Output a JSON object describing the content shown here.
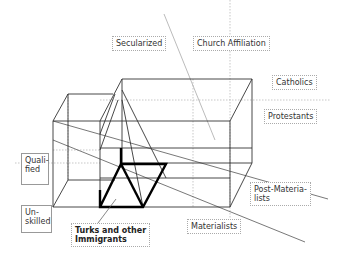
{
  "diagram": {
    "type": "3D social-space cube diagram",
    "labels": {
      "secularized": "Secularized",
      "church_affiliation": "Church Affiliation",
      "catholics": "Catholics",
      "protestants": "Protestants",
      "qualified_line1": "Quali-",
      "qualified_line2": "fied",
      "unskilled_line1": "Un-",
      "unskilled_line2": "skilled",
      "turks_line1": "Turks and other",
      "turks_line2": "Immigrants",
      "post_materialists_line1": "Post-Materia-",
      "post_materialists_line2": "lists",
      "materialists": "Materialists"
    },
    "axes": {
      "religion": [
        "Secularized",
        "Church Affiliation",
        "Catholics",
        "Protestants"
      ],
      "qualification": [
        "Qualified",
        "Unskilled"
      ],
      "values": [
        "Post-Materialists",
        "Materialists"
      ]
    },
    "highlighted_group": "Turks and other Immigrants",
    "colors": {
      "line": "#333333",
      "dotted": "#aaaaaa",
      "bold": "#000000"
    }
  }
}
